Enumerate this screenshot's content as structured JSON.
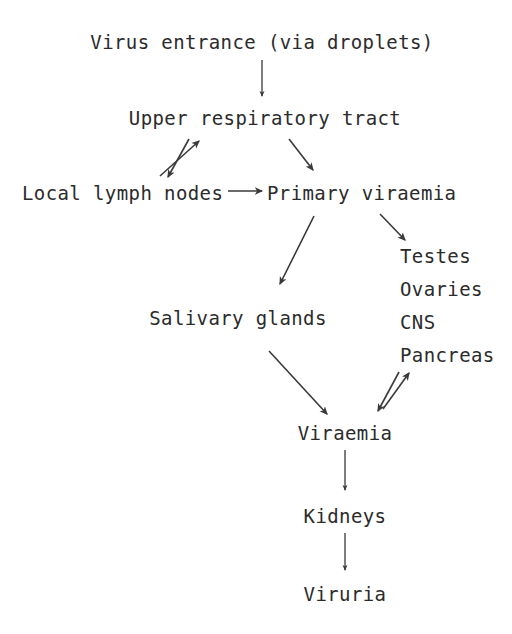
{
  "diagram": {
    "type": "flowchart",
    "background_color": "#ffffff",
    "text_color": "#2b2b2b",
    "arrow_color": "#3a3a3a",
    "nodes": [
      {
        "id": "entrance",
        "label": "Virus entrance (via droplets)"
      },
      {
        "id": "urt",
        "label": "Upper respiratory tract"
      },
      {
        "id": "lymph",
        "label": "Local lymph nodes"
      },
      {
        "id": "primary",
        "label": "Primary viraemia"
      },
      {
        "id": "salivary",
        "label": "Salivary glands"
      },
      {
        "id": "viraemia",
        "label": "Viraemia"
      },
      {
        "id": "kidneys",
        "label": "Kidneys"
      },
      {
        "id": "viruria",
        "label": "Viruria"
      }
    ],
    "organ_targets": [
      {
        "id": "testes",
        "label": "Testes"
      },
      {
        "id": "ovaries",
        "label": "Ovaries"
      },
      {
        "id": "cns",
        "label": "CNS"
      },
      {
        "id": "pancreas",
        "label": "Pancreas"
      }
    ],
    "edges": [
      {
        "from": "entrance",
        "to": "urt",
        "style": "straight-down",
        "direction": "one-way"
      },
      {
        "from": "urt",
        "to": "lymph",
        "style": "diagonal",
        "direction": "two-way"
      },
      {
        "from": "lymph",
        "to": "primary",
        "style": "horizontal",
        "direction": "one-way"
      },
      {
        "from": "urt",
        "to": "primary",
        "style": "diagonal",
        "direction": "one-way"
      },
      {
        "from": "primary",
        "to": "salivary",
        "style": "diagonal-long",
        "direction": "one-way"
      },
      {
        "from": "primary",
        "to": "organ_targets",
        "style": "diagonal",
        "direction": "one-way"
      },
      {
        "from": "salivary",
        "to": "viraemia",
        "style": "diagonal-long",
        "direction": "one-way"
      },
      {
        "from": "organ_targets",
        "to": "viraemia",
        "style": "diagonal",
        "direction": "two-way"
      },
      {
        "from": "viraemia",
        "to": "kidneys",
        "style": "straight-down",
        "direction": "one-way"
      },
      {
        "from": "kidneys",
        "to": "viruria",
        "style": "straight-down",
        "direction": "one-way"
      }
    ]
  }
}
